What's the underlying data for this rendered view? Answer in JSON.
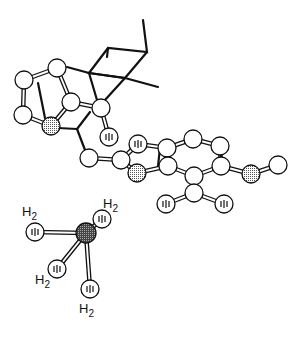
{
  "figure": {
    "type": "molecular-structure-ball-and-stick",
    "colors": {
      "line": "#111111",
      "atom_fill": "#ffffff",
      "dotted_fill": "#c8c8c8",
      "metal_fill": "#707070"
    }
  },
  "atoms": [
    {
      "id": "c1",
      "x": 24,
      "y": 80,
      "kind": "plain"
    },
    {
      "id": "c2",
      "x": 57,
      "y": 68,
      "kind": "plain"
    },
    {
      "id": "c3",
      "x": 23,
      "y": 115,
      "kind": "plain"
    },
    {
      "id": "c4",
      "x": 71,
      "y": 102,
      "kind": "plain"
    },
    {
      "id": "n1",
      "x": 51,
      "y": 126,
      "kind": "dotted"
    },
    {
      "id": "c6",
      "x": 101,
      "y": 108,
      "kind": "plain"
    },
    {
      "id": "o1",
      "x": 109,
      "y": 137,
      "kind": "striped"
    },
    {
      "id": "c7",
      "x": 89,
      "y": 158,
      "kind": "plain"
    },
    {
      "id": "c8",
      "x": 121,
      "y": 160,
      "kind": "plain"
    },
    {
      "id": "o2",
      "x": 138,
      "y": 144,
      "kind": "striped"
    },
    {
      "id": "n2",
      "x": 137,
      "y": 173,
      "kind": "dotted"
    },
    {
      "id": "c9",
      "x": 167,
      "y": 148,
      "kind": "plain"
    },
    {
      "id": "c10",
      "x": 168,
      "y": 166,
      "kind": "plain"
    },
    {
      "id": "c11",
      "x": 193,
      "y": 139,
      "kind": "plain"
    },
    {
      "id": "c12",
      "x": 220,
      "y": 146,
      "kind": "plain"
    },
    {
      "id": "c13",
      "x": 194,
      "y": 176,
      "kind": "plain"
    },
    {
      "id": "c14",
      "x": 221,
      "y": 166,
      "kind": "plain"
    },
    {
      "id": "n3",
      "x": 251,
      "y": 174,
      "kind": "dotted"
    },
    {
      "id": "c15",
      "x": 278,
      "y": 165,
      "kind": "plain"
    },
    {
      "id": "c16",
      "x": 194,
      "y": 193,
      "kind": "plain"
    },
    {
      "id": "o3",
      "x": 166,
      "y": 204,
      "kind": "striped"
    },
    {
      "id": "o4",
      "x": 224,
      "y": 204,
      "kind": "striped"
    },
    {
      "id": "m1",
      "x": 86,
      "y": 233,
      "kind": "metal"
    },
    {
      "id": "h1",
      "x": 35,
      "y": 232,
      "kind": "striped"
    },
    {
      "id": "h2",
      "x": 102,
      "y": 219,
      "kind": "striped"
    },
    {
      "id": "h3",
      "x": 57,
      "y": 269,
      "kind": "striped"
    },
    {
      "id": "h4",
      "x": 90,
      "y": 289,
      "kind": "striped"
    }
  ],
  "labels": [
    {
      "text": "H",
      "sub": "2",
      "x": 22,
      "y": 216
    },
    {
      "text": "H",
      "sub": "2",
      "x": 103,
      "y": 208
    },
    {
      "text": "H",
      "sub": "2",
      "x": 35,
      "y": 284
    },
    {
      "text": "H",
      "sub": "2",
      "x": 79,
      "y": 313
    }
  ]
}
